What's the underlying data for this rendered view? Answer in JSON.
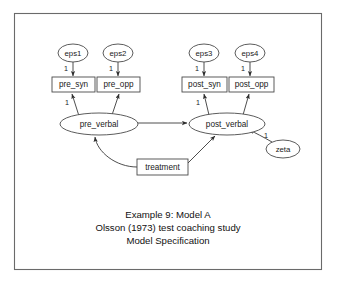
{
  "figure": {
    "title_lines": [
      "Example 9:  Model A",
      "Olsson (1973) test coaching study",
      "Model Specification"
    ]
  },
  "diagram": {
    "type": "sem-path-diagram",
    "errors": [
      {
        "id": "eps1",
        "label": "eps1",
        "cx": 73,
        "cy": 53,
        "rx": 15,
        "ry": 9
      },
      {
        "id": "eps2",
        "label": "eps2",
        "cx": 118,
        "cy": 53,
        "rx": 15,
        "ry": 9
      },
      {
        "id": "eps3",
        "label": "eps3",
        "cx": 204,
        "cy": 53,
        "rx": 15,
        "ry": 9
      },
      {
        "id": "eps4",
        "label": "eps4",
        "cx": 250,
        "cy": 53,
        "rx": 15,
        "ry": 9
      }
    ],
    "observed": [
      {
        "id": "pre_syn",
        "label": "pre_syn",
        "x": 52,
        "y": 77,
        "w": 43,
        "h": 15
      },
      {
        "id": "pre_opp",
        "label": "pre_opp",
        "x": 97,
        "y": 77,
        "w": 43,
        "h": 15
      },
      {
        "id": "post_syn",
        "label": "post_syn",
        "x": 182,
        "y": 77,
        "w": 45,
        "h": 15
      },
      {
        "id": "post_opp",
        "label": "post_opp",
        "x": 229,
        "y": 77,
        "w": 45,
        "h": 15
      }
    ],
    "latents": [
      {
        "id": "pre_verbal",
        "label": "pre_verbal",
        "cx": 99,
        "cy": 124,
        "rx": 39,
        "ry": 11
      },
      {
        "id": "post_verbal",
        "label": "post_verbal",
        "cx": 227,
        "cy": 124,
        "rx": 38,
        "ry": 11
      }
    ],
    "exogenous": [
      {
        "id": "treatment",
        "label": "treatment",
        "x": 137,
        "y": 159,
        "w": 51,
        "h": 16
      }
    ],
    "disturbances": [
      {
        "id": "zeta",
        "label": "zeta",
        "cx": 283,
        "cy": 149,
        "rx": 17,
        "ry": 9
      }
    ],
    "coefficients": [
      {
        "id": "eps1-load",
        "value": "1",
        "x": 65,
        "y": 69
      },
      {
        "id": "eps2-load",
        "value": "1",
        "x": 110,
        "y": 69
      },
      {
        "id": "eps3-load",
        "value": "1",
        "x": 196,
        "y": 69
      },
      {
        "id": "eps4-load",
        "value": "1",
        "x": 242,
        "y": 69
      },
      {
        "id": "pre-load",
        "value": "1",
        "x": 67,
        "y": 103
      },
      {
        "id": "post-load",
        "value": "1",
        "x": 198,
        "y": 103
      },
      {
        "id": "zeta-load",
        "value": "1",
        "x": 266,
        "y": 136
      }
    ],
    "edges": [
      {
        "id": "eps1-to-pre_syn",
        "from": "eps1",
        "to": "pre_syn",
        "labeled": "1"
      },
      {
        "id": "eps2-to-pre_opp",
        "from": "eps2",
        "to": "pre_opp",
        "labeled": "1"
      },
      {
        "id": "eps3-to-post_syn",
        "from": "eps3",
        "to": "post_syn",
        "labeled": "1"
      },
      {
        "id": "eps4-to-post_opp",
        "from": "eps4",
        "to": "post_opp",
        "labeled": "1"
      },
      {
        "id": "pre_verbal-to-pre_syn",
        "from": "pre_verbal",
        "to": "pre_syn",
        "labeled": "1"
      },
      {
        "id": "pre_verbal-to-pre_opp",
        "from": "pre_verbal",
        "to": "pre_opp",
        "labeled": ""
      },
      {
        "id": "post_verbal-to-post_syn",
        "from": "post_verbal",
        "to": "post_syn",
        "labeled": "1"
      },
      {
        "id": "post_verbal-to-post_opp",
        "from": "post_verbal",
        "to": "post_opp",
        "labeled": ""
      },
      {
        "id": "pre_verbal-to-post_verbal",
        "from": "pre_verbal",
        "to": "post_verbal",
        "labeled": ""
      },
      {
        "id": "treatment-to-pre_verbal",
        "from": "treatment",
        "to": "pre_verbal",
        "labeled": ""
      },
      {
        "id": "treatment-to-post_verbal",
        "from": "treatment",
        "to": "post_verbal",
        "labeled": ""
      },
      {
        "id": "zeta-to-post_verbal",
        "from": "zeta",
        "to": "post_verbal",
        "labeled": "1"
      }
    ]
  }
}
